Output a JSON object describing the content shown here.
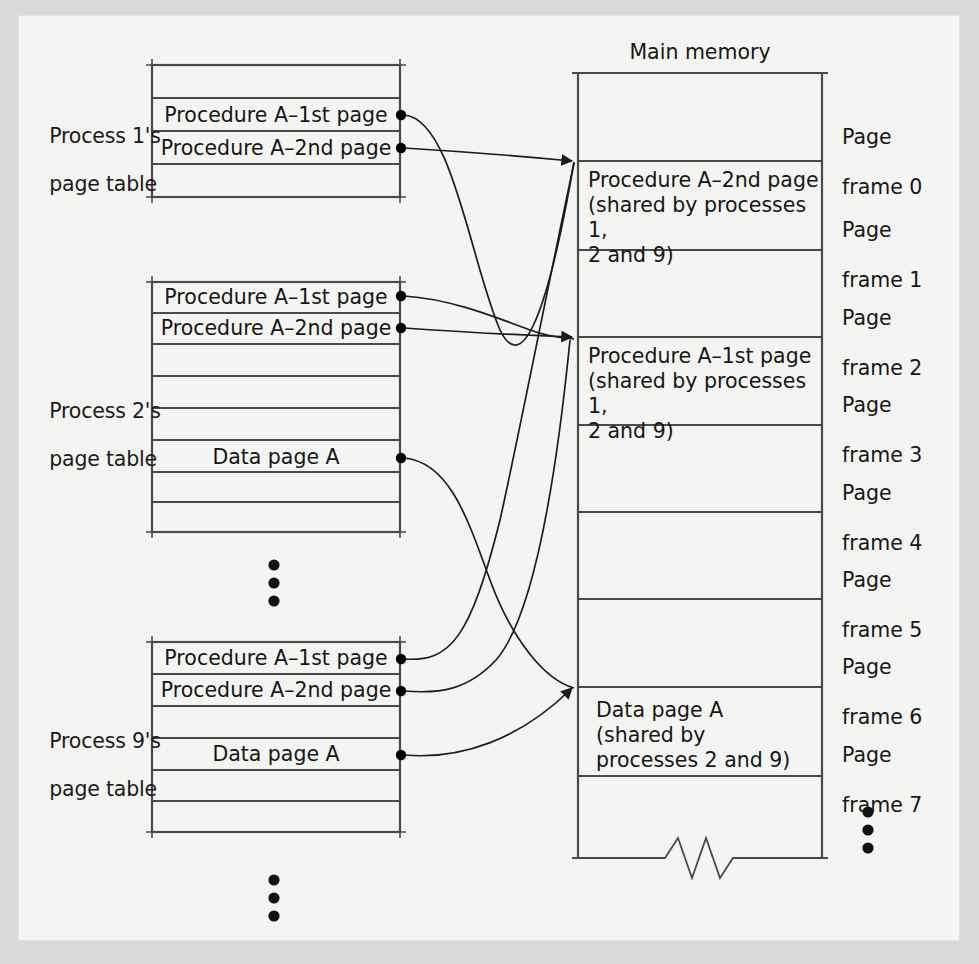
{
  "figure": {
    "title_main_memory": "Main memory",
    "type": "diagram"
  },
  "colors": {
    "page_background": "#f4f4f2",
    "outside_background": "#d9d9d9",
    "line": "#4a4a4a",
    "text": "#161616",
    "dot": "#000000"
  },
  "page_tables": [
    {
      "id": "process-1",
      "label": "Process 1's\npage table",
      "label_line1": "Process 1's",
      "label_line2": "page table",
      "rows": [
        {
          "text": "",
          "has_dot": false
        },
        {
          "text": "Procedure A–1st page",
          "has_dot": true
        },
        {
          "text": "Procedure A–2nd page",
          "has_dot": true
        },
        {
          "text": "",
          "has_dot": false
        }
      ]
    },
    {
      "id": "process-2",
      "label": "Process 2's\npage table",
      "label_line1": "Process 2's",
      "label_line2": "page table",
      "rows": [
        {
          "text": "Procedure A–1st page",
          "has_dot": true
        },
        {
          "text": "Procedure A–2nd page",
          "has_dot": true
        },
        {
          "text": "",
          "has_dot": false
        },
        {
          "text": "",
          "has_dot": false
        },
        {
          "text": "",
          "has_dot": false
        },
        {
          "text": "Data page A",
          "has_dot": true
        },
        {
          "text": "",
          "has_dot": false
        },
        {
          "text": "",
          "has_dot": false
        }
      ]
    },
    {
      "id": "process-9",
      "label": "Process 9's\npage table",
      "label_line1": "Process 9's",
      "label_line2": "page table",
      "rows": [
        {
          "text": "Procedure A–1st page",
          "has_dot": true
        },
        {
          "text": "Procedure A–2nd page",
          "has_dot": true
        },
        {
          "text": "",
          "has_dot": false
        },
        {
          "text": "Data page A",
          "has_dot": true
        },
        {
          "text": "",
          "has_dot": false
        },
        {
          "text": "",
          "has_dot": false
        }
      ]
    }
  ],
  "main_memory": {
    "title": "Main memory",
    "frames": [
      {
        "label": "Page\nframe 0",
        "label_line1": "Page",
        "label_line2": "frame 0",
        "content": ""
      },
      {
        "label": "Page\nframe 1",
        "label_line1": "Page",
        "label_line2": "frame 1",
        "content": "Procedure A–2nd page\n(shared by processes 1,\n2 and 9)"
      },
      {
        "label": "Page\nframe 2",
        "label_line1": "Page",
        "label_line2": "frame 2",
        "content": ""
      },
      {
        "label": "Page\nframe 3",
        "label_line1": "Page",
        "label_line2": "frame 3",
        "content": "Procedure A–1st page\n(shared by processes 1,\n2 and 9)"
      },
      {
        "label": "Page\nframe 4",
        "label_line1": "Page",
        "label_line2": "frame 4",
        "content": ""
      },
      {
        "label": "Page\nframe 5",
        "label_line1": "Page",
        "label_line2": "frame 5",
        "content": ""
      },
      {
        "label": "Page\nframe 6",
        "label_line1": "Page",
        "label_line2": "frame 6",
        "content": ""
      },
      {
        "label": "Page\nframe 7",
        "label_line1": "Page",
        "label_line2": "frame 7",
        "content": "Data page A\n(shared by\nprocesses 2 and 9)"
      },
      {
        "label": "",
        "label_line1": "",
        "label_line2": "",
        "content": ""
      }
    ],
    "continuation_indicator": "vertical-ellipsis",
    "break_symbol": "zigzag"
  },
  "ellipses": [
    {
      "id": "between-table-2-and-9",
      "glyph": "⋮"
    },
    {
      "id": "below-table-9",
      "glyph": "⋮"
    },
    {
      "id": "below-memory-frames",
      "glyph": "⋮"
    }
  ],
  "mappings": [
    {
      "from": "process-1 / Procedure A–1st page",
      "to": "Page frame 3"
    },
    {
      "from": "process-1 / Procedure A–2nd page",
      "to": "Page frame 1"
    },
    {
      "from": "process-2 / Procedure A–1st page",
      "to": "Page frame 3"
    },
    {
      "from": "process-2 / Procedure A–2nd page",
      "to": "Page frame 1"
    },
    {
      "from": "process-2 / Data page A",
      "to": "Page frame 7"
    },
    {
      "from": "process-9 / Procedure A–1st page",
      "to": "Page frame 3"
    },
    {
      "from": "process-9 / Procedure A–2nd page",
      "to": "Page frame 1"
    },
    {
      "from": "process-9 / Data page A",
      "to": "Page frame 7"
    }
  ]
}
